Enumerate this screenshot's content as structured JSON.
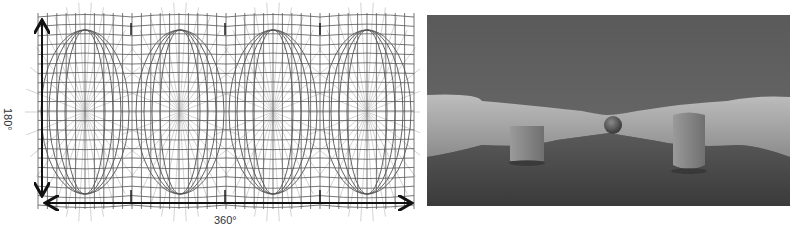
{
  "figure": {
    "left_panel": {
      "kind": "equirectangular-grid",
      "horizontal_label": "360°",
      "vertical_label": "180°",
      "grid": {
        "x0": 38,
        "x1": 414,
        "y0": 17,
        "y1": 205,
        "vertical_line_count": 40,
        "horizontal_line_count": 20,
        "face_boundaries_x": [
          131,
          225,
          320
        ],
        "oval_centers_x": [
          85,
          180,
          273,
          367
        ],
        "oval_rx": 44,
        "oval_ry": 82,
        "oval_cy": 112,
        "colors": {
          "grid": "#555555",
          "radial": "#c8c8c8",
          "arrow": "#111111"
        }
      }
    },
    "right_panel": {
      "kind": "equirectangular-render",
      "objects": [
        "cube",
        "sphere",
        "cylinder"
      ],
      "colors": {
        "ceiling": "#5f5f5f",
        "wall": "#a9a9a9",
        "floor": "#4a4a4a",
        "object": "#8a8a8a"
      }
    }
  }
}
